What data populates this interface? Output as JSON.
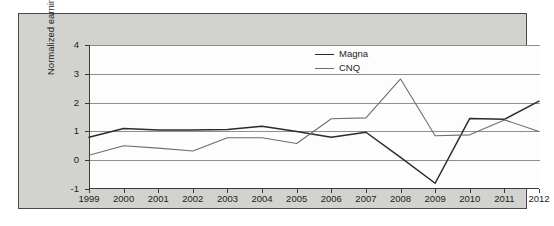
{
  "chart_data": {
    "type": "line",
    "title": "",
    "xlabel": "",
    "ylabel": "Normalized earnings per share",
    "x": [
      1999,
      2000,
      2001,
      2002,
      2003,
      2004,
      2005,
      2006,
      2007,
      2008,
      2009,
      2010,
      2011,
      2012
    ],
    "categories": [
      "1999",
      "2000",
      "2001",
      "2002",
      "2003",
      "2004",
      "2005",
      "2006",
      "2007",
      "2008",
      "2009",
      "2010",
      "2011",
      "2012"
    ],
    "xlim": [
      1999,
      2012
    ],
    "ylim": [
      -1,
      4
    ],
    "yticks": [
      -1,
      0,
      1,
      2,
      3,
      4
    ],
    "ytick_labels": [
      "-1",
      "0",
      "1",
      "2",
      "3",
      "4"
    ],
    "grid": true,
    "legend_position": "top-center-right",
    "series": [
      {
        "name": "Magna",
        "color": "#2b2b2b",
        "values": [
          0.8,
          1.1,
          1.05,
          1.05,
          1.07,
          1.18,
          1.0,
          0.8,
          0.97,
          0.1,
          -0.8,
          1.45,
          1.42,
          2.05
        ]
      },
      {
        "name": "CNQ",
        "color": "#6e6e6e",
        "values": [
          0.17,
          0.5,
          0.42,
          0.32,
          0.78,
          0.78,
          0.58,
          1.44,
          1.47,
          2.82,
          0.85,
          0.88,
          1.4,
          1.0
        ]
      }
    ]
  },
  "legend": {
    "entries": [
      {
        "label": "Magna",
        "color": "#2b2b2b"
      },
      {
        "label": "CNQ",
        "color": "#6e6e6e"
      }
    ]
  },
  "axes": {
    "y_label": "Normalized earnings per share",
    "y_tick_labels": [
      "4",
      "3",
      "2",
      "1",
      "0",
      "-1"
    ],
    "x_tick_labels": [
      "1999",
      "2000",
      "2001",
      "2002",
      "2003",
      "2004",
      "2005",
      "2006",
      "2007",
      "2008",
      "2009",
      "2010",
      "2011",
      "2012"
    ]
  },
  "colors": {
    "panel_background": "#d2d2cf",
    "plot_background": "#fdfdfd",
    "axis": "#3a3a38",
    "gridline": "#8e8e8c",
    "magna": "#2b2b2b",
    "cnq": "#6e6e6e"
  }
}
